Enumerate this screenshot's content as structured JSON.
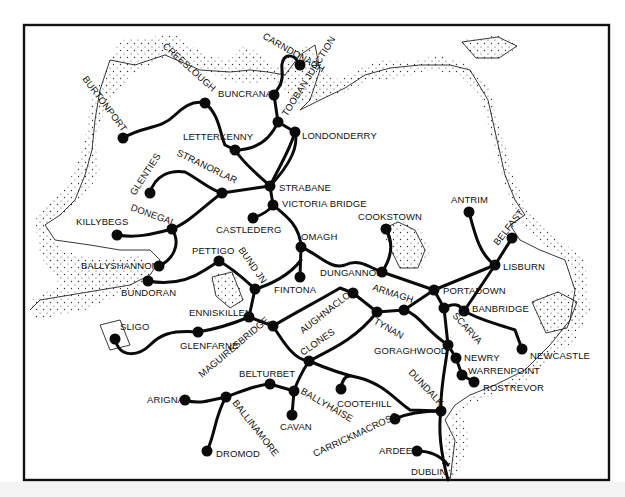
{
  "map": {
    "title": "Railway network of the north of Ireland",
    "colors": {
      "rail": "#0a0a0a",
      "coast": "#222222",
      "frame": "#111111",
      "background": "#ffffff"
    },
    "stations": [
      {
        "id": "carndonagh",
        "label": "CARNDONAGH",
        "x": 300,
        "y": 65,
        "lx": 262,
        "ly": 38,
        "rot": 30
      },
      {
        "id": "buncrana",
        "label": "BUNCRANA",
        "x": 274,
        "y": 95,
        "lx": 218,
        "ly": 97,
        "rot": 0
      },
      {
        "id": "tooban_junction",
        "label": "TOOBAN JUNCTION",
        "x": 278,
        "y": 122,
        "lx": 283,
        "ly": 118,
        "rot": -58
      },
      {
        "id": "londonderry",
        "label": "LONDONDERRY",
        "x": 295,
        "y": 132,
        "lx": 302,
        "ly": 139,
        "rot": 0
      },
      {
        "id": "creeslough",
        "label": "CREESLOUGH",
        "x": 205,
        "y": 103,
        "lx": 160,
        "ly": 50,
        "rot": 42
      },
      {
        "id": "burtonport",
        "label": "BURTONPORT",
        "x": 123,
        "y": 138,
        "lx": 82,
        "ly": 80,
        "rot": 53
      },
      {
        "id": "letterkenny",
        "label": "LETTERKENNY",
        "x": 235,
        "y": 150,
        "lx": 183,
        "ly": 140,
        "rot": 0
      },
      {
        "id": "glenties",
        "label": "GLENTIES",
        "x": 150,
        "y": 193,
        "lx": 130,
        "ly": 188,
        "rot": -57
      },
      {
        "id": "stranorlar",
        "label": "STRANORLAR",
        "x": 222,
        "y": 193,
        "lx": 176,
        "ly": 158,
        "rot": 26
      },
      {
        "id": "strabane",
        "label": "STRABANE",
        "x": 270,
        "y": 186,
        "lx": 279,
        "ly": 191,
        "rot": 0
      },
      {
        "id": "victoria_bridge",
        "label": "VICTORIA BRIDGE",
        "x": 273,
        "y": 205,
        "lx": 282,
        "ly": 207,
        "rot": 0
      },
      {
        "id": "castlederg",
        "label": "CASTLEDERG",
        "x": 253,
        "y": 218,
        "lx": 216,
        "ly": 233,
        "rot": 0
      },
      {
        "id": "donegal",
        "label": "DONEGAL",
        "x": 172,
        "y": 229,
        "lx": 130,
        "ly": 212,
        "rot": 20
      },
      {
        "id": "killybegs",
        "label": "KILLYBEGS",
        "x": 117,
        "y": 235,
        "lx": 76,
        "ly": 225,
        "rot": 0
      },
      {
        "id": "omagh",
        "label": "OMAGH",
        "x": 301,
        "y": 247,
        "lx": 301,
        "ly": 240,
        "rot": 0
      },
      {
        "id": "ballyshannon",
        "label": "BALLYSHANNON",
        "x": 159,
        "y": 266,
        "lx": 81,
        "ly": 269,
        "rot": 0
      },
      {
        "id": "bundoran",
        "label": "BUNDORAN",
        "x": 148,
        "y": 281,
        "lx": 121,
        "ly": 296,
        "rot": 0
      },
      {
        "id": "pettigo",
        "label": "PETTIGO",
        "x": 219,
        "y": 261,
        "lx": 192,
        "ly": 254,
        "rot": 0
      },
      {
        "id": "bund_jn",
        "label": "BUND JN",
        "x": 255,
        "y": 289,
        "lx": 236,
        "ly": 252,
        "rot": 55
      },
      {
        "id": "fintona",
        "label": "FINTONA",
        "x": 300,
        "y": 277,
        "lx": 274,
        "ly": 293,
        "rot": 0
      },
      {
        "id": "cookstown",
        "label": "COOKSTOWN",
        "x": 386,
        "y": 229,
        "lx": 358,
        "ly": 220,
        "rot": 0
      },
      {
        "id": "dungannon",
        "label": "DUNGANNON",
        "x": 382,
        "y": 272,
        "lx": 320,
        "ly": 276,
        "rot": 0
      },
      {
        "id": "antrim",
        "label": "ANTRIM",
        "x": 469,
        "y": 212,
        "lx": 451,
        "ly": 203,
        "rot": 0
      },
      {
        "id": "belfast",
        "label": "BELFAST",
        "x": 512,
        "y": 238,
        "lx": 496,
        "ly": 246,
        "rot": -52
      },
      {
        "id": "lisburn",
        "label": "LISBURN",
        "x": 495,
        "y": 265,
        "lx": 503,
        "ly": 270,
        "rot": 0
      },
      {
        "id": "portadown",
        "label": "PORTADOWN",
        "x": 434,
        "y": 290,
        "lx": 443,
        "ly": 294,
        "rot": 0
      },
      {
        "id": "armagh",
        "label": "ARMAGH",
        "x": 404,
        "y": 310,
        "lx": 372,
        "ly": 291,
        "rot": 18
      },
      {
        "id": "banbridge",
        "label": "BANBRIDGE",
        "x": 464,
        "y": 311,
        "lx": 472,
        "ly": 312,
        "rot": 0
      },
      {
        "id": "scarva",
        "label": "SCARVA",
        "x": 444,
        "y": 308,
        "lx": 451,
        "ly": 318,
        "rot": 48
      },
      {
        "id": "enniskillen",
        "label": "ENNISKILLEN",
        "x": 249,
        "y": 317,
        "lx": 189,
        "ly": 316,
        "rot": 0
      },
      {
        "id": "maguiresbridge",
        "label": "MAGUIRESBRIDGE",
        "x": 273,
        "y": 326,
        "lx": 202,
        "ly": 378,
        "rot": -40
      },
      {
        "id": "aughnacloy",
        "label": "AUGHNACLOY",
        "x": 353,
        "y": 293,
        "lx": 302,
        "ly": 334,
        "rot": -38
      },
      {
        "id": "tynan",
        "label": "TYNAN",
        "x": 377,
        "y": 312,
        "lx": 372,
        "ly": 327,
        "rot": 30
      },
      {
        "id": "glenfarne",
        "label": "GLENFARNE",
        "x": 198,
        "y": 332,
        "lx": 180,
        "ly": 349,
        "rot": 0
      },
      {
        "id": "sligo",
        "label": "SLIGO",
        "x": 115,
        "y": 339,
        "lx": 120,
        "ly": 330,
        "rot": 0
      },
      {
        "id": "clones",
        "label": "CLONES",
        "x": 309,
        "y": 361,
        "lx": 303,
        "ly": 358,
        "rot": -35
      },
      {
        "id": "goraghwood",
        "label": "GORAGHWOOD",
        "x": 448,
        "y": 345,
        "lx": 374,
        "ly": 354,
        "rot": 0
      },
      {
        "id": "newry",
        "label": "NEWRY",
        "x": 456,
        "y": 358,
        "lx": 464,
        "ly": 361,
        "rot": 0
      },
      {
        "id": "warrenpoint",
        "label": "WARRENPOINT",
        "x": 462,
        "y": 375,
        "lx": 468,
        "ly": 375,
        "rot": 0
      },
      {
        "id": "rostrevor",
        "label": "ROSTREVOR",
        "x": 474,
        "y": 382,
        "lx": 483,
        "ly": 391,
        "rot": 0
      },
      {
        "id": "newcastle",
        "label": "NEWCASTLE",
        "x": 522,
        "y": 349,
        "lx": 530,
        "ly": 359,
        "rot": 0
      },
      {
        "id": "belturbet",
        "label": "BELTURBET",
        "x": 270,
        "y": 384,
        "lx": 239,
        "ly": 377,
        "rot": 0
      },
      {
        "id": "ballyhaise",
        "label": "BALLYHAISE",
        "x": 294,
        "y": 391,
        "lx": 300,
        "ly": 393,
        "rot": 30
      },
      {
        "id": "cootehill",
        "label": "COOTEHILL",
        "x": 341,
        "y": 389,
        "lx": 337,
        "ly": 407,
        "rot": 0
      },
      {
        "id": "arigna",
        "label": "ARIGNA",
        "x": 185,
        "y": 400,
        "lx": 147,
        "ly": 403,
        "rot": 0
      },
      {
        "id": "ballinamore",
        "label": "BALLINAMORE",
        "x": 226,
        "y": 397,
        "lx": 232,
        "ly": 405,
        "rot": 52
      },
      {
        "id": "cavan",
        "label": "CAVAN",
        "x": 292,
        "y": 415,
        "lx": 280,
        "ly": 430,
        "rot": 0
      },
      {
        "id": "dundalk",
        "label": "DUNDALK",
        "x": 441,
        "y": 411,
        "lx": 406,
        "ly": 375,
        "rot": 47
      },
      {
        "id": "carrickmacross",
        "label": "CARRICKMACROSS",
        "x": 395,
        "y": 419,
        "lx": 315,
        "ly": 457,
        "rot": -25
      },
      {
        "id": "ardee",
        "label": "ARDEE",
        "x": 417,
        "y": 451,
        "lx": 379,
        "ly": 454,
        "rot": 0
      },
      {
        "id": "dromod",
        "label": "DROMOD",
        "x": 207,
        "y": 451,
        "lx": 216,
        "ly": 457,
        "rot": 0
      },
      {
        "id": "dublin",
        "label": "DUBLIN ↓",
        "x": 0,
        "y": 0,
        "lx": 411,
        "ly": 475,
        "rot": 0
      }
    ]
  }
}
